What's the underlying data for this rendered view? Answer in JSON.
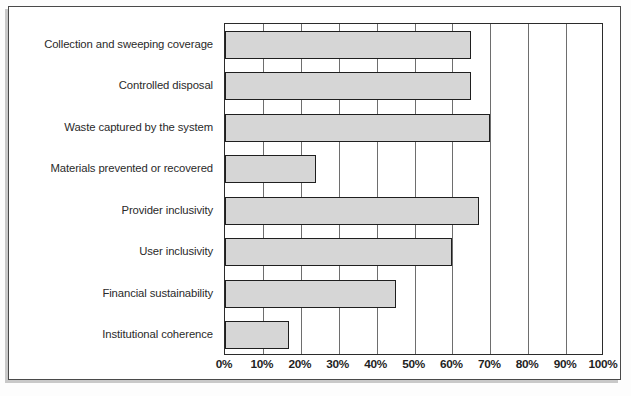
{
  "figure": {
    "background_color": "#ffffff",
    "frame_color": "#4a4a4a",
    "plot_border_color": "#2b2b2b",
    "bar_fill_color": "#d6d6d6",
    "bar_border_color": "#1f1f1f",
    "gridline_color": "#6e6e6e"
  },
  "chart_data": {
    "type": "bar",
    "orientation": "horizontal",
    "title": "",
    "subtitle": "",
    "xlabel": "",
    "ylabel": "",
    "xlim": [
      0,
      100
    ],
    "xtick_labels": [
      "0%",
      "10%",
      "20%",
      "30%",
      "40%",
      "50%",
      "60%",
      "70%",
      "80%",
      "90%",
      "100%"
    ],
    "xtick_values": [
      0,
      10,
      20,
      30,
      40,
      50,
      60,
      70,
      80,
      90,
      100
    ],
    "grid": true,
    "grid_axis": "x",
    "legend": false,
    "legend_position": "none",
    "categories": [
      "Collection and sweeping coverage",
      "Controlled disposal",
      "Waste captured by the system",
      "Materials prevented or recovered",
      "Provider inclusivity",
      "User inclusivity",
      "Financial sustainability",
      "Institutional coherence"
    ],
    "values": [
      65,
      65,
      70,
      24,
      67,
      60,
      45,
      17
    ],
    "value_unit": "%",
    "series": [
      {
        "name": "",
        "values": [
          65,
          65,
          70,
          24,
          67,
          60,
          45,
          17
        ]
      }
    ]
  }
}
